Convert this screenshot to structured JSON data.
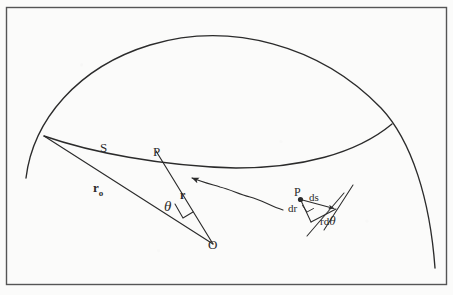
{
  "figure": {
    "kind": "line-diagram",
    "background_color": "#fbfbfa",
    "ink_color": "#2b2b2b",
    "frame": {
      "name": "figure-border",
      "x": 6,
      "y": 7,
      "width": 441,
      "height": 278,
      "stroke": "#555555"
    },
    "labels": {
      "s": "S",
      "p": "P",
      "r_zero": "r",
      "r_zero_sub": "o",
      "r": "r",
      "theta": "θ",
      "o": "O",
      "inset_p": "P",
      "inset_ds": "ds",
      "inset_dr": "dr",
      "inset_rdtheta_prefix": "rd",
      "inset_rdtheta_theta": "θ"
    },
    "geometry": {
      "outer_arc": "M 26 178 Q 60 64 176 40 Q 300 34 392 124 Q 428 186 435 268",
      "inner_arc": "M 44 136 Q 150 165 244 168 Q 330 164 392 124",
      "ray_r0": "M 44 136 L 212 243",
      "ray_r": "M 157 152 L 212 243",
      "right_angle_mark": "M 176 206 L 182 217 L 190 212",
      "wavy_ray": "M 278 205 C 262 198 252 193 238 190 C 224 187 212 185 198 180",
      "wavy_arrow_tip": [
        186,
        176
      ],
      "inset": {
        "point": [
          300,
          199
        ],
        "ds_end": [
          336,
          209
        ],
        "dr_end": [
          310,
          222
        ],
        "right_angle": "M 303 206 L 307 212 L 312 209",
        "tangent_line": "M 325 228 L 352 186",
        "radial_line": "M 308 235 L 342 194"
      }
    }
  }
}
